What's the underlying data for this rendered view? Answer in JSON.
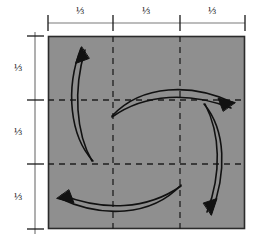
{
  "figure": {
    "background_color": "#ffffff",
    "square": {
      "fill_color": "#8f8f8f",
      "border_color": "#2b2b2b",
      "x": 48,
      "y": 36,
      "width": 197,
      "height": 193
    },
    "grid": {
      "line_color": "#1f1f1f",
      "style": "dashed",
      "dash_pattern": "6,5",
      "vertical_lines": [
        113,
        180
      ],
      "horizontal_lines": [
        100,
        164
      ]
    },
    "rulers": {
      "line_color": "#6e6e6e",
      "tick_color": "#1a1a1a",
      "top": {
        "axis_y": 23,
        "x_start": 48,
        "x_end": 245,
        "tick_positions": [
          48,
          113,
          180,
          245
        ],
        "labels": [
          {
            "text": "⅓",
            "x": 80,
            "y": 11
          },
          {
            "text": "⅓",
            "x": 146,
            "y": 11
          },
          {
            "text": "⅓",
            "x": 212,
            "y": 11
          }
        ]
      },
      "left": {
        "axis_x": 35,
        "y_start": 36,
        "y_end": 229,
        "tick_positions": [
          36,
          100,
          164,
          229
        ],
        "labels": [
          {
            "text": "⅓",
            "x": 18,
            "y": 68
          },
          {
            "text": "⅓",
            "x": 18,
            "y": 132
          },
          {
            "text": "⅓",
            "x": 18,
            "y": 197
          }
        ]
      }
    },
    "arrows": {
      "stroke_color": "#111111",
      "stroke_width": 1.6,
      "rotation_direction": "counterclockwise",
      "items": [
        {
          "name": "arrow-left-up",
          "direction": "up",
          "head_at": "top",
          "path": "M 92 160 C 70 136 66 90 82 48",
          "head_path": "M 82 48 L 78.5 62 L 88.5 60 Z"
        },
        {
          "name": "arrow-top-right",
          "direction": "right",
          "head_at": "right",
          "path": "M 113 116 C 140 86 190 84 233 104",
          "head_path": "M 233 104 L 220 99.5 L 224 109.5 Z"
        },
        {
          "name": "arrow-right-down",
          "direction": "down",
          "head_at": "bottom",
          "path": "M 205 105 C 225 130 226 172 210 213",
          "head_path": "M 210 213 L 213.5 199 L 203.5 201.5 Z"
        },
        {
          "name": "arrow-bottom-left",
          "direction": "left",
          "head_at": "left",
          "path": "M 180 186 C 152 215 104 218 59 198",
          "head_path": "M 59 198 L 72 202.5 L 68 192.5 Z"
        }
      ]
    }
  }
}
